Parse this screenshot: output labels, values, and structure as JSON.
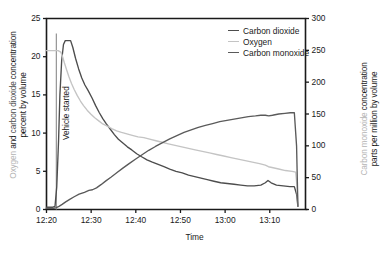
{
  "chart_data": {
    "type": "line",
    "title": "",
    "xlabel": "Time",
    "ylabel_left": "Oxygen and carbon dioxide concentration percent by volume",
    "ylabel_left_part1": "Oxygen",
    "ylabel_left_part2": "and",
    "ylabel_left_part3": "carbon dioxide",
    "ylabel_left_part4": "concentration",
    "ylabel_left_line2": "percent by volume",
    "ylabel_right": "Carbon monoxide concentration parts per million by volume",
    "ylabel_right_part1": "Carbon monoxide",
    "ylabel_right_part2": "concentration",
    "ylabel_right_line2": "parts per million by volume",
    "xtick_labels": [
      "12:20",
      "12:30",
      "12:40",
      "12:50",
      "13:00",
      "13:10"
    ],
    "xtick_values": [
      0,
      10,
      20,
      30,
      40,
      50
    ],
    "xlim": [
      0,
      58
    ],
    "ytick_labels_left": [
      "0",
      "5",
      "10",
      "15",
      "20",
      "25"
    ],
    "ylim_left": [
      0,
      25
    ],
    "ytick_labels_right": [
      "0",
      "50",
      "100",
      "150",
      "200",
      "250",
      "300"
    ],
    "ylim_right": [
      0,
      300
    ],
    "grid": false,
    "legend_position": "top-right",
    "annotation": "Vehicle started",
    "annotation_x": 2.2,
    "series": [
      {
        "name": "Carbon dioxide",
        "color": "#4d4d4d",
        "axis": "left",
        "points": [
          [
            0.0,
            0.3
          ],
          [
            1.4,
            0.3
          ],
          [
            1.9,
            0.4
          ],
          [
            2.3,
            3.0
          ],
          [
            2.7,
            9.0
          ],
          [
            3.0,
            15.0
          ],
          [
            3.4,
            19.5
          ],
          [
            3.8,
            21.6
          ],
          [
            4.2,
            22.1
          ],
          [
            4.8,
            22.1
          ],
          [
            5.4,
            22.1
          ],
          [
            5.9,
            21.2
          ],
          [
            6.5,
            19.8
          ],
          [
            7.2,
            18.4
          ],
          [
            7.9,
            17.2
          ],
          [
            8.6,
            16.3
          ],
          [
            9.3,
            15.6
          ],
          [
            10.2,
            14.6
          ],
          [
            11.0,
            13.6
          ],
          [
            11.8,
            12.7
          ],
          [
            12.6,
            11.9
          ],
          [
            13.4,
            11.2
          ],
          [
            14.3,
            10.5
          ],
          [
            15.2,
            9.8
          ],
          [
            16.1,
            9.2
          ],
          [
            17.1,
            8.7
          ],
          [
            18.1,
            8.2
          ],
          [
            19.1,
            7.8
          ],
          [
            20.2,
            7.3
          ],
          [
            21.3,
            6.9
          ],
          [
            22.5,
            6.5
          ],
          [
            23.7,
            6.2
          ],
          [
            25.0,
            5.9
          ],
          [
            26.3,
            5.6
          ],
          [
            27.6,
            5.3
          ],
          [
            29.0,
            5.0
          ],
          [
            30.4,
            4.8
          ],
          [
            31.8,
            4.5
          ],
          [
            33.2,
            4.3
          ],
          [
            34.6,
            4.1
          ],
          [
            36.0,
            3.9
          ],
          [
            37.5,
            3.7
          ],
          [
            39.0,
            3.5
          ],
          [
            40.5,
            3.4
          ],
          [
            42.0,
            3.3
          ],
          [
            43.5,
            3.2
          ],
          [
            45.0,
            3.1
          ],
          [
            46.5,
            3.1
          ],
          [
            48.0,
            3.2
          ],
          [
            49.0,
            3.5
          ],
          [
            49.6,
            3.8
          ],
          [
            50.3,
            3.5
          ],
          [
            51.5,
            3.2
          ],
          [
            53.0,
            3.1
          ],
          [
            54.5,
            3.0
          ],
          [
            55.5,
            3.0
          ],
          [
            56.0,
            2.0
          ],
          [
            56.3,
            0.4
          ]
        ]
      },
      {
        "name": "Oxygen",
        "color": "#c4c4c4",
        "axis": "left",
        "points": [
          [
            0.0,
            20.8
          ],
          [
            1.5,
            20.8
          ],
          [
            2.6,
            20.8
          ],
          [
            3.2,
            20.6
          ],
          [
            3.6,
            20.0
          ],
          [
            4.0,
            19.2
          ],
          [
            4.5,
            18.3
          ],
          [
            5.0,
            17.4
          ],
          [
            5.6,
            16.5
          ],
          [
            6.2,
            15.7
          ],
          [
            6.9,
            14.9
          ],
          [
            7.6,
            14.2
          ],
          [
            8.3,
            13.6
          ],
          [
            9.1,
            13.0
          ],
          [
            9.9,
            12.5
          ],
          [
            10.8,
            12.0
          ],
          [
            11.7,
            11.6
          ],
          [
            12.6,
            11.2
          ],
          [
            13.6,
            10.9
          ],
          [
            14.6,
            10.6
          ],
          [
            15.7,
            10.3
          ],
          [
            16.8,
            10.1
          ],
          [
            18.0,
            9.9
          ],
          [
            19.2,
            9.7
          ],
          [
            20.5,
            9.5
          ],
          [
            21.8,
            9.4
          ],
          [
            23.1,
            9.2
          ],
          [
            24.5,
            9.0
          ],
          [
            25.9,
            8.8
          ],
          [
            27.3,
            8.6
          ],
          [
            28.8,
            8.4
          ],
          [
            30.3,
            8.2
          ],
          [
            31.8,
            8.0
          ],
          [
            33.3,
            7.8
          ],
          [
            34.9,
            7.6
          ],
          [
            36.5,
            7.4
          ],
          [
            38.1,
            7.2
          ],
          [
            39.7,
            7.0
          ],
          [
            41.3,
            6.8
          ],
          [
            42.9,
            6.6
          ],
          [
            44.5,
            6.4
          ],
          [
            46.1,
            6.2
          ],
          [
            47.7,
            6.0
          ],
          [
            49.0,
            5.8
          ],
          [
            49.7,
            5.6
          ],
          [
            50.5,
            5.5
          ],
          [
            52.0,
            5.3
          ],
          [
            53.5,
            5.1
          ],
          [
            55.0,
            5.0
          ],
          [
            55.8,
            4.9
          ],
          [
            56.1,
            3.0
          ],
          [
            56.3,
            0.4
          ]
        ]
      },
      {
        "name": "Carbon monoxide",
        "color": "#5a5a5a",
        "axis": "right",
        "points": [
          [
            0.0,
            2
          ],
          [
            1.6,
            2
          ],
          [
            2.2,
            3
          ],
          [
            2.8,
            5
          ],
          [
            3.5,
            8
          ],
          [
            4.3,
            12
          ],
          [
            5.2,
            16
          ],
          [
            6.2,
            20
          ],
          [
            7.3,
            24
          ],
          [
            8.5,
            27
          ],
          [
            9.5,
            30
          ],
          [
            10.3,
            31
          ],
          [
            11.2,
            34
          ],
          [
            12.2,
            39
          ],
          [
            13.3,
            45
          ],
          [
            14.5,
            51
          ],
          [
            15.8,
            58
          ],
          [
            17.1,
            65
          ],
          [
            18.5,
            72
          ],
          [
            19.9,
            79
          ],
          [
            21.4,
            86
          ],
          [
            22.9,
            93
          ],
          [
            24.4,
            99
          ],
          [
            26.0,
            105
          ],
          [
            27.6,
            111
          ],
          [
            29.2,
            116
          ],
          [
            30.8,
            121
          ],
          [
            32.4,
            125
          ],
          [
            34.0,
            129
          ],
          [
            35.6,
            132
          ],
          [
            37.2,
            135
          ],
          [
            38.8,
            138
          ],
          [
            40.4,
            140
          ],
          [
            42.0,
            142
          ],
          [
            43.6,
            144
          ],
          [
            45.2,
            146
          ],
          [
            46.8,
            147
          ],
          [
            48.0,
            148
          ],
          [
            49.0,
            148
          ],
          [
            49.8,
            147
          ],
          [
            50.6,
            148
          ],
          [
            52.0,
            150
          ],
          [
            53.4,
            151
          ],
          [
            54.6,
            152
          ],
          [
            55.5,
            152
          ],
          [
            56.0,
            100
          ],
          [
            56.3,
            5
          ]
        ]
      }
    ]
  },
  "legend": {
    "items": [
      {
        "label": "Carbon dioxide",
        "color": "#4d4d4d"
      },
      {
        "label": "Oxygen",
        "color": "#c4c4c4"
      },
      {
        "label": "Carbon monoxide",
        "color": "#5a5a5a"
      }
    ]
  }
}
